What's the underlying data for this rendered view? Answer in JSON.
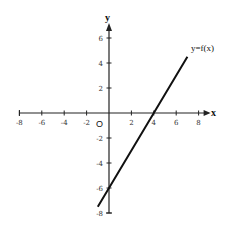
{
  "chart_data": {
    "type": "line",
    "title": "",
    "xlabel": "x",
    "ylabel": "y",
    "origin_label": "O",
    "xlim": [
      -8,
      8
    ],
    "ylim": [
      -8,
      6
    ],
    "x_ticks": [
      -8,
      -6,
      -4,
      -2,
      2,
      4,
      6,
      8
    ],
    "x_tick_labels": [
      "-8",
      "-6",
      "-4",
      "-2",
      "2",
      "4",
      "6",
      "8"
    ],
    "y_ticks": [
      6,
      4,
      2,
      -2,
      -4,
      -6,
      -8
    ],
    "y_tick_labels": [
      "6",
      "4",
      "2",
      "-2",
      "-4",
      "-6",
      "-8"
    ],
    "grid": false,
    "legend": null,
    "series": [
      {
        "name": "y=f(x)",
        "label": "y=f(x)",
        "x": [
          -1,
          0,
          4,
          7
        ],
        "y": [
          -7.5,
          -6,
          0,
          4.5
        ],
        "slope": 1.5,
        "intercept": -6,
        "x_intercept": 4,
        "color": "#111111"
      }
    ]
  }
}
